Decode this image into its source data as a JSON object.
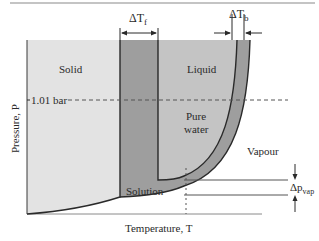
{
  "diagram": {
    "type": "phase-diagram",
    "title": "",
    "regions": {
      "solid": "Solid",
      "liquid": "Liquid",
      "pure_water_line1": "Pure",
      "pure_water_line2": "water",
      "vapour": "Vapour",
      "solution": "Solution"
    },
    "axes": {
      "ylabel": "Pressure, P",
      "xlabel": "Temperature, T"
    },
    "reference_line": {
      "label": "1.01 bar"
    },
    "annotations": {
      "delta_tf": {
        "symbol": "ΔT",
        "subscript": "f"
      },
      "delta_tb": {
        "symbol": "ΔT",
        "subscript": "b"
      },
      "delta_pvap": {
        "symbol": "Δp",
        "subscript": "vap"
      }
    },
    "colors": {
      "solid_region": "#e3e3e3",
      "solution_band": "#9e9e9e",
      "liquid_region": "#c4c4c4",
      "vapour_region": "#ffffff",
      "lines": "#2a2a2a",
      "frame": "#8a8a8a"
    }
  }
}
